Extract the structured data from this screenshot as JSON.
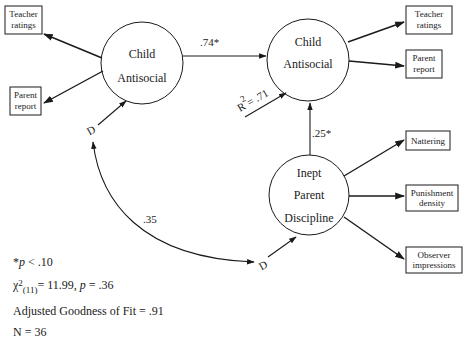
{
  "diagram": {
    "nodes": {
      "child_antisocial_t1": {
        "line1": "Child",
        "line2": "Antisocial"
      },
      "child_antisocial_t2": {
        "line1": "Child",
        "line2": "Antisocial"
      },
      "inept_parent_discipline": {
        "line1": "Inept",
        "line2": "Parent",
        "line3": "Discipline"
      }
    },
    "indicators": {
      "t1_teacher": {
        "line1": "Teacher",
        "line2": "ratings"
      },
      "t1_parent": {
        "line1": "Parent",
        "line2": "report"
      },
      "t2_teacher": {
        "line1": "Teacher",
        "line2": "ratings"
      },
      "t2_parent": {
        "line1": "Parent",
        "line2": "report"
      },
      "ipd_nattering": {
        "line1": "Nattering"
      },
      "ipd_punishment": {
        "line1": "Punishment",
        "line2": "density"
      },
      "ipd_observer": {
        "line1": "Observer",
        "line2": "impressions"
      }
    },
    "paths": {
      "t1_to_t2": ".74*",
      "ipd_to_t2": ".25*",
      "correlation_d": ".35",
      "r_squared_label": "R",
      "r_squared_exp": "2",
      "r_squared_value": " = .71"
    },
    "disturbance_labels": {
      "d1": "D",
      "d2": "D"
    }
  },
  "notes": {
    "significance": {
      "star": "*",
      "p": "p",
      "rest": " < .10"
    },
    "chi_square": {
      "symbol": "χ",
      "sup": "2",
      "sub": "(11)",
      "rest": "= 11.99, ",
      "p": "p",
      "p_rest": " = .36"
    },
    "agfi": "Adjusted Goodness of Fit = .91",
    "n": "N = 36"
  }
}
